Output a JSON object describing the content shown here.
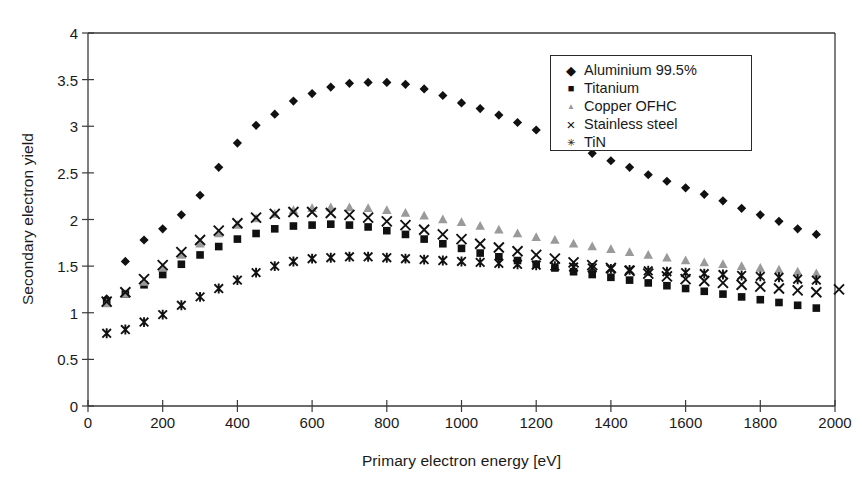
{
  "chart_data": {
    "type": "scatter",
    "title": "",
    "xlabel": "Primary electron energy [eV]",
    "ylabel": "Secondary electron yield",
    "xlim": [
      0,
      2000
    ],
    "ylim": [
      0,
      4
    ],
    "xticks": [
      0,
      200,
      400,
      600,
      800,
      1000,
      1200,
      1400,
      1600,
      1800,
      2000
    ],
    "yticks": [
      0,
      0.5,
      1,
      1.5,
      2,
      2.5,
      3,
      3.5,
      4
    ],
    "grid": false,
    "legend_position": "upper-right",
    "x": [
      50,
      100,
      150,
      200,
      250,
      300,
      350,
      400,
      450,
      500,
      550,
      600,
      650,
      700,
      750,
      800,
      850,
      900,
      950,
      1000,
      1050,
      1100,
      1150,
      1200,
      1250,
      1300,
      1350,
      1400,
      1450,
      1500,
      1550,
      1600,
      1650,
      1700,
      1750,
      1800,
      1850,
      1900,
      1950
    ],
    "series": [
      {
        "name": "Aluminium 99.5%",
        "marker": "diamond",
        "color": "#111111",
        "values": [
          1.15,
          1.55,
          1.78,
          1.9,
          2.05,
          2.26,
          2.56,
          2.82,
          3.01,
          3.13,
          3.27,
          3.35,
          3.42,
          3.46,
          3.47,
          3.47,
          3.45,
          3.4,
          3.33,
          3.25,
          3.19,
          3.12,
          3.04,
          2.96,
          2.88,
          2.79,
          2.71,
          2.63,
          2.56,
          2.48,
          2.41,
          2.34,
          2.27,
          2.2,
          2.12,
          2.05,
          1.98,
          1.9,
          1.84
        ]
      },
      {
        "name": "Titanium",
        "marker": "square",
        "color": "#111111",
        "values": [
          1.12,
          1.2,
          1.3,
          1.41,
          1.52,
          1.62,
          1.71,
          1.79,
          1.85,
          1.9,
          1.93,
          1.94,
          1.95,
          1.94,
          1.92,
          1.88,
          1.84,
          1.79,
          1.74,
          1.69,
          1.64,
          1.6,
          1.56,
          1.52,
          1.48,
          1.44,
          1.41,
          1.38,
          1.35,
          1.32,
          1.29,
          1.26,
          1.23,
          1.2,
          1.17,
          1.14,
          1.11,
          1.08,
          1.05
        ]
      },
      {
        "name": "Copper OFHC",
        "marker": "triangle",
        "color": "#9a9a9a",
        "values": [
          1.1,
          1.2,
          1.33,
          1.48,
          1.62,
          1.74,
          1.85,
          1.94,
          2.01,
          2.06,
          2.1,
          2.12,
          2.13,
          2.13,
          2.12,
          2.1,
          2.07,
          2.04,
          2.0,
          1.97,
          1.93,
          1.89,
          1.85,
          1.81,
          1.78,
          1.74,
          1.71,
          1.68,
          1.65,
          1.62,
          1.59,
          1.56,
          1.54,
          1.52,
          1.5,
          1.48,
          1.46,
          1.44,
          1.42
        ]
      },
      {
        "name": "Stainless steel",
        "marker": "cross",
        "color": "#111111",
        "values": [
          1.12,
          1.22,
          1.36,
          1.51,
          1.65,
          1.78,
          1.88,
          1.96,
          2.02,
          2.06,
          2.08,
          2.08,
          2.07,
          2.05,
          2.02,
          1.98,
          1.94,
          1.89,
          1.84,
          1.79,
          1.74,
          1.7,
          1.66,
          1.62,
          1.58,
          1.54,
          1.51,
          1.48,
          1.45,
          1.42,
          1.39,
          1.36,
          1.34,
          1.32,
          1.3,
          1.28,
          1.26,
          1.24,
          1.22
        ]
      },
      {
        "name": "TiN",
        "marker": "star",
        "color": "#111111",
        "values": [
          0.78,
          0.82,
          0.9,
          0.98,
          1.08,
          1.17,
          1.26,
          1.35,
          1.43,
          1.5,
          1.55,
          1.58,
          1.59,
          1.6,
          1.6,
          1.59,
          1.58,
          1.57,
          1.56,
          1.55,
          1.54,
          1.53,
          1.52,
          1.51,
          1.5,
          1.49,
          1.48,
          1.47,
          1.46,
          1.45,
          1.44,
          1.43,
          1.42,
          1.41,
          1.4,
          1.39,
          1.38,
          1.36,
          1.35
        ]
      }
    ],
    "extra_points": [
      {
        "series": "Stainless steel",
        "x": 2000,
        "y": 1.25
      }
    ],
    "axis_color": "#3a3a3a",
    "legend": [
      {
        "label": "Aluminium 99.5%",
        "marker": "diamond",
        "color": "#111111"
      },
      {
        "label": "Titanium",
        "marker": "square",
        "color": "#111111"
      },
      {
        "label": "Copper OFHC",
        "marker": "triangle",
        "color": "#9a9a9a"
      },
      {
        "label": "Stainless steel",
        "marker": "cross",
        "color": "#111111"
      },
      {
        "label": "TiN",
        "marker": "star",
        "color": "#111111"
      }
    ]
  }
}
